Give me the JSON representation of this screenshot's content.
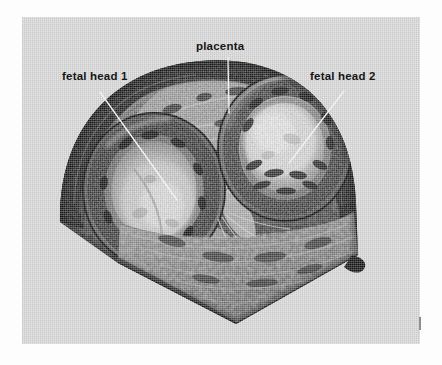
{
  "figure": {
    "kind": "three-dimensional-ultrasound-photograph",
    "plate_background_color": "#d5d5d5",
    "page_background_color": "#fdfdfd",
    "label_color": "#171717",
    "leader_line_color": "#f2f2f2",
    "corner_mark": {
      "name": "plate-corner-tick",
      "color": "#8f8f8f"
    }
  },
  "annotations": {
    "placenta": {
      "label": "placenta",
      "leader": {
        "x1": 228,
        "y1": 58,
        "x2": 229,
        "y2": 113
      }
    },
    "fetal_head_1": {
      "label": "fetal  head 1",
      "leader": {
        "x1": 100,
        "y1": 92,
        "x2": 177,
        "y2": 200
      }
    },
    "fetal_head_2": {
      "label": "fetal  head 2",
      "leader": {
        "x1": 344,
        "y1": 91,
        "x2": 289,
        "y2": 163
      }
    }
  },
  "scan_content": {
    "description": "Rendered volume of a twin gestation showing two fetal heads and the placenta within the uterine cavity",
    "structures": [
      "uterine wall",
      "placenta",
      "fetal head 1",
      "fetal head 2",
      "amniotic fluid",
      "dividing membrane"
    ]
  }
}
